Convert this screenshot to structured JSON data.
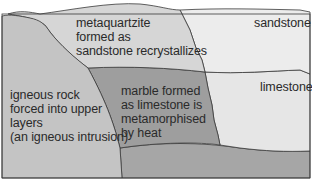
{
  "diagram": {
    "type": "geological cross-section",
    "colors": {
      "igneous": "#c4c4c4",
      "metaquartzite": "#d6d6d6",
      "sandstone": "#ececec",
      "marble": "#9e9e9e",
      "limestone": "#e6e6e6",
      "base_layer": "#a6a6a6",
      "outline": "#3a3a3a"
    },
    "labels": {
      "metaquartzite": "metaquartzite\nformed as\nsandstone recrystallizes",
      "sandstone": "sandstone",
      "limestone": "limestone",
      "marble": "marble formed\nas limestone is\nmetamorphised\nby heat",
      "igneous": "igneous rock\nforced into upper\nlayers\n(an igneous intrusion)"
    }
  }
}
